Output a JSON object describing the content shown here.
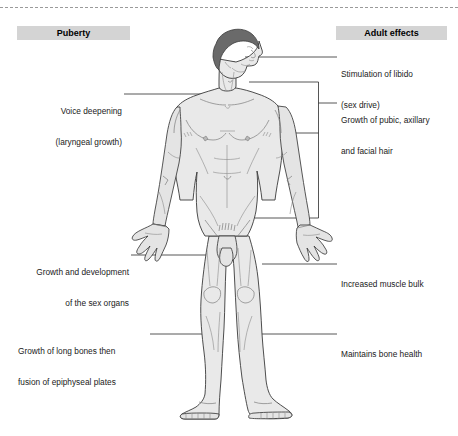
{
  "diagram": {
    "title_left": "Puberty",
    "title_right": "Adult effects",
    "labels_left": [
      {
        "id": "voice",
        "line1": "Voice deepening",
        "line2": "(laryngeal growth)"
      },
      {
        "id": "sex-organs",
        "line1": "Growth and development",
        "line2": "of the sex organs"
      },
      {
        "id": "long-bones",
        "line1": "Growth of long bones then",
        "line2": "fusion of epiphyseal plates"
      }
    ],
    "labels_right": [
      {
        "id": "libido",
        "line1": "Stimulation of libido",
        "line2": "(sex drive)"
      },
      {
        "id": "hair",
        "line1": "Growth of pubic, axillary",
        "line2": "and facial hair"
      },
      {
        "id": "muscle",
        "line1": "Increased muscle bulk",
        "line2": ""
      },
      {
        "id": "bone",
        "line1": "Maintains bone health",
        "line2": ""
      }
    ],
    "colors": {
      "header_bg": "#d4d4d4",
      "skin": "#e9e9e9",
      "hair": "#6a6a6a",
      "outline": "#3a3a3a",
      "leader": "#2b2b2b",
      "background": "#ffffff"
    }
  }
}
